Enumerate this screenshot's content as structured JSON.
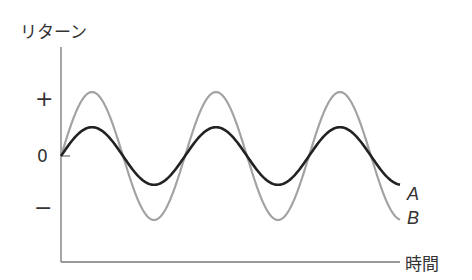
{
  "chart_data": {
    "type": "line",
    "title": "",
    "xlabel": "時間",
    "ylabel": "リターン",
    "y_ticks": [
      "+",
      "0",
      "−"
    ],
    "grid": false,
    "legend_position": "inline-right",
    "x": [
      0,
      0.5,
      1,
      1.5,
      2,
      2.5,
      3,
      3.5,
      4,
      4.5,
      5,
      5.5
    ],
    "series": [
      {
        "name": "A",
        "color": "#222222",
        "amplitude": 0.45,
        "values": [
          0,
          0.45,
          0,
          -0.45,
          0,
          0.45,
          0,
          -0.45,
          0,
          0.45,
          0,
          -0.45
        ]
      },
      {
        "name": "B",
        "color": "#9a9a9a",
        "amplitude": 1.0,
        "values": [
          0,
          1.0,
          0,
          -1.0,
          0,
          1.0,
          0,
          -1.0,
          0,
          1.0,
          0,
          -1.0
        ]
      }
    ],
    "ylim": [
      -1.3,
      1.3
    ]
  },
  "labels": {
    "ylabel": "リターン",
    "xlabel": "時間",
    "plus": "+",
    "zero": "0",
    "minus": "−",
    "series_a": "A",
    "series_b": "B"
  }
}
